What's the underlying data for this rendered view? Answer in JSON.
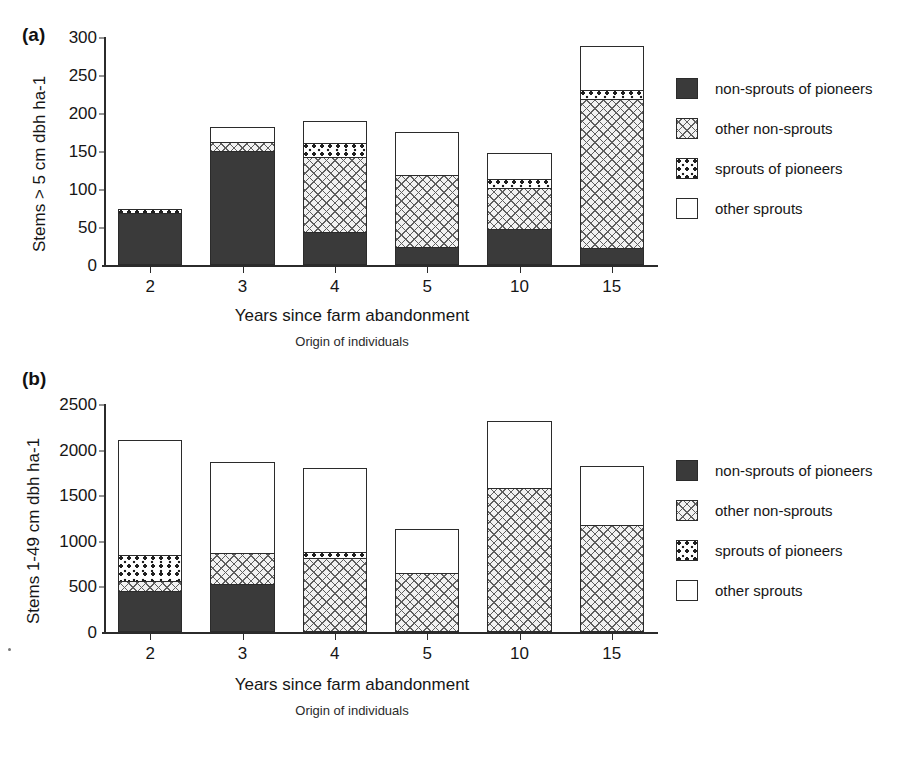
{
  "figure": {
    "panels": [
      {
        "letter": "(a)",
        "ylabel": "Stems > 5 cm dbh ha-1",
        "xlabel": "Years since farm abandonment",
        "xsublabel": "Origin of individuals"
      },
      {
        "letter": "(b)",
        "ylabel": "Stems 1-49 cm dbh ha-1",
        "xlabel": "Years since farm abandonment",
        "xsublabel": "Origin of individuals"
      }
    ]
  },
  "legend": {
    "items": [
      {
        "label": "non-sprouts of pioneers",
        "pattern": "solid-dark"
      },
      {
        "label": "other non-sprouts",
        "pattern": "cross-hatch"
      },
      {
        "label": "sprouts of pioneers",
        "pattern": "dotted"
      },
      {
        "label": "other sprouts",
        "pattern": "white"
      }
    ]
  },
  "chart_data": [
    {
      "type": "bar",
      "stacked": true,
      "panel": "(a)",
      "title": "",
      "xlabel": "Years since farm abandonment",
      "ylabel": "Stems > 5 cm dbh ha-1",
      "xsublabel": "Origin of individuals",
      "categories": [
        "2",
        "3",
        "4",
        "5",
        "10",
        "15"
      ],
      "yticks": [
        0,
        50,
        100,
        150,
        200,
        250,
        300
      ],
      "ylim": [
        0,
        300
      ],
      "grid": false,
      "legend_position": "right",
      "series": [
        {
          "name": "non-sprouts of pioneers",
          "values": [
            68,
            150,
            42,
            22,
            46,
            20
          ]
        },
        {
          "name": "other non-sprouts",
          "values": [
            0,
            12,
            99,
            95,
            54,
            198
          ]
        },
        {
          "name": "sprouts of pioneers",
          "values": [
            6,
            0,
            19,
            0,
            12,
            12
          ]
        },
        {
          "name": "other sprouts",
          "values": [
            0,
            19,
            30,
            58,
            36,
            58
          ]
        }
      ],
      "totals": [
        74,
        181,
        190,
        175,
        148,
        288
      ]
    },
    {
      "type": "bar",
      "stacked": true,
      "panel": "(b)",
      "title": "",
      "xlabel": "Years since farm abandonment",
      "ylabel": "Stems 1-49 cm dbh ha-1",
      "xsublabel": "Origin of individuals",
      "categories": [
        "2",
        "3",
        "4",
        "5",
        "10",
        "15"
      ],
      "yticks": [
        0,
        500,
        1000,
        1500,
        2000,
        2500
      ],
      "ylim": [
        0,
        2500
      ],
      "grid": false,
      "legend_position": "right",
      "series": [
        {
          "name": "non-sprouts of pioneers",
          "values": [
            430,
            510,
            0,
            0,
            0,
            0
          ]
        },
        {
          "name": "other non-sprouts",
          "values": [
            110,
            350,
            800,
            640,
            1570,
            1170
          ]
        },
        {
          "name": "sprouts of pioneers",
          "values": [
            290,
            0,
            70,
            0,
            0,
            0
          ]
        },
        {
          "name": "other sprouts",
          "values": [
            1280,
            1000,
            930,
            490,
            740,
            650
          ]
        }
      ],
      "totals": [
        2110,
        1860,
        1800,
        1130,
        2310,
        1820
      ]
    }
  ]
}
